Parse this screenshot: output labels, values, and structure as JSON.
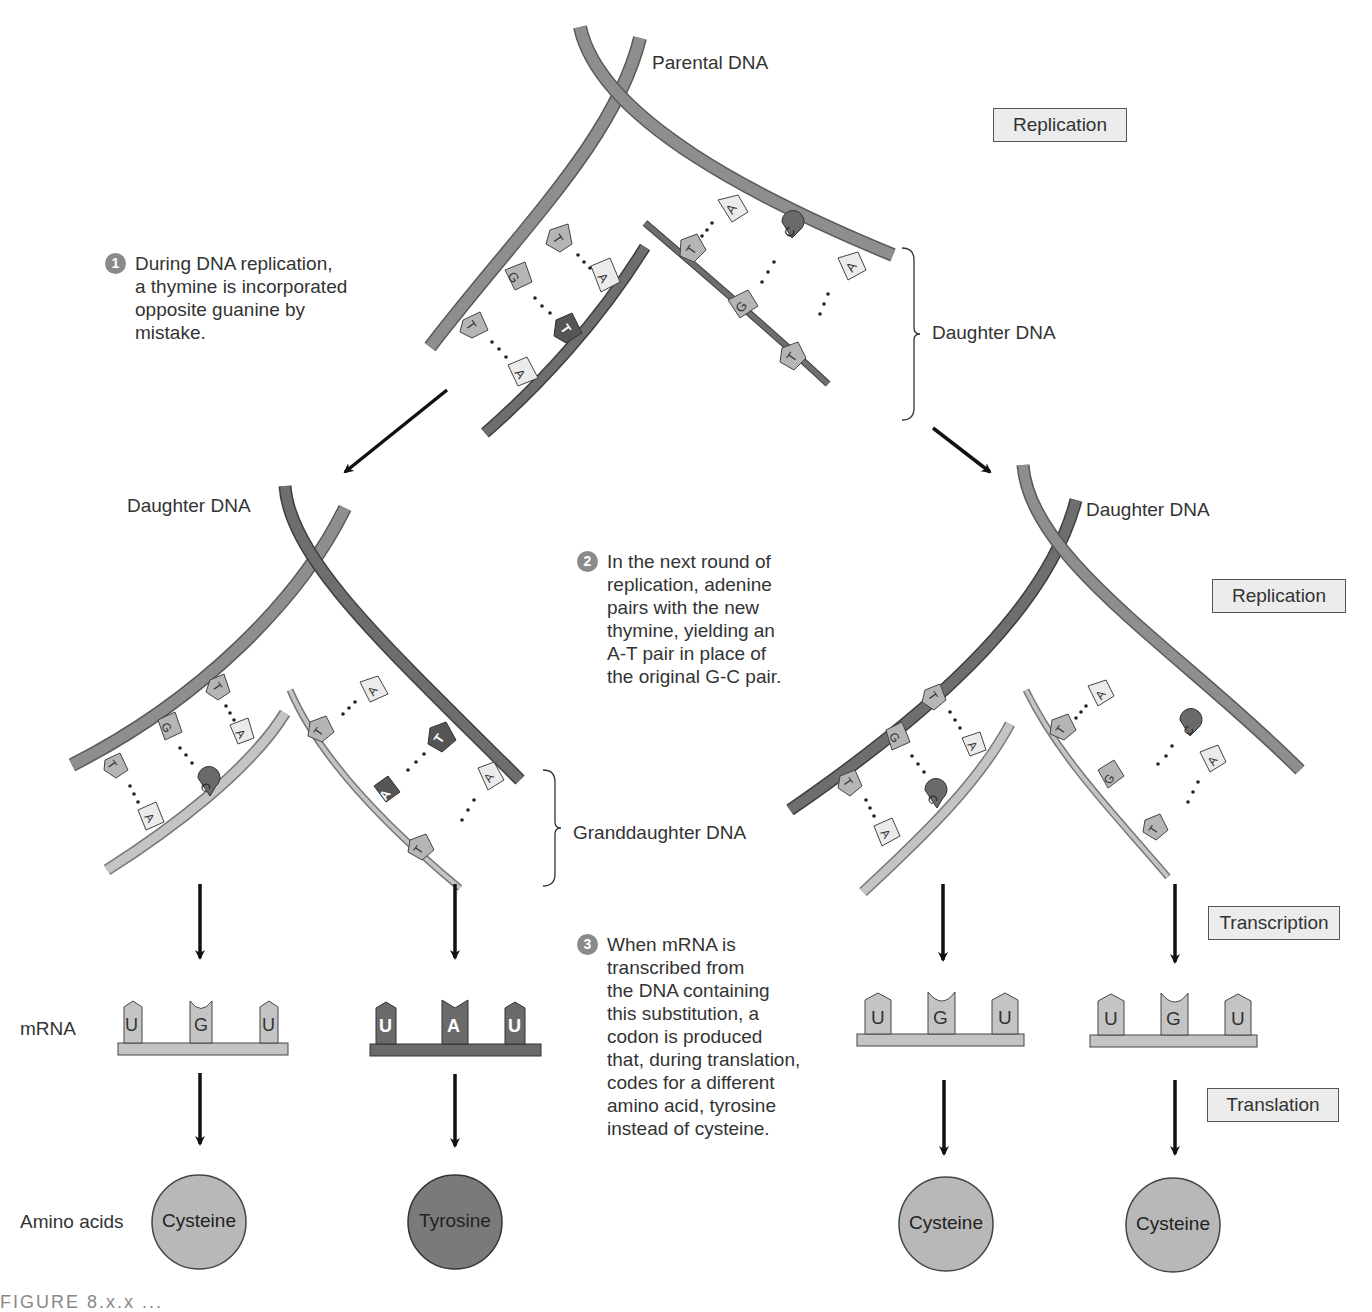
{
  "labels": {
    "parental_dna": "Parental DNA",
    "daughter_dna_top": "Daughter DNA",
    "daughter_dna_left": "Daughter DNA",
    "daughter_dna_right": "Daughter DNA",
    "granddaughter_dna": "Granddaughter DNA",
    "mrna": "mRNA",
    "amino_acids": "Amino acids"
  },
  "process_boxes": {
    "replication_top": "Replication",
    "replication_right": "Replication",
    "transcription": "Transcription",
    "translation": "Translation"
  },
  "steps": [
    {
      "num": "1",
      "text": "During DNA replication,\na thymine is incorporated\nopposite guanine by\nmistake."
    },
    {
      "num": "2",
      "text": "In the next round of\nreplication, adenine\npairs with the new\nthymine, yielding an\nA-T pair in place of\nthe original G-C pair."
    },
    {
      "num": "3",
      "text": "When mRNA is\ntranscribed from\nthe DNA containing\nthis substitution, a\ncodon is produced\nthat, during translation,\ncodes for a different\namino acid, tyrosine\ninstead of cysteine."
    }
  ],
  "bases": {
    "top_left_parent": [
      "T",
      "G",
      "T"
    ],
    "top_left_daughter": [
      "A",
      "T",
      "A"
    ],
    "top_right_parent": [
      "A",
      "C",
      "A"
    ],
    "top_right_daughter": [
      "T",
      "G",
      "T"
    ],
    "left_left_parent": [
      "T",
      "G",
      "T"
    ],
    "left_left_daughter": [
      "A",
      "C",
      "A"
    ],
    "left_right_parent": [
      "A",
      "T",
      "A"
    ],
    "left_right_daughter": [
      "T",
      "A",
      "T"
    ],
    "right_left_parent": [
      "T",
      "G",
      "T"
    ],
    "right_left_daughter": [
      "A",
      "C",
      "A"
    ],
    "right_right_parent": [
      "A",
      "C",
      "A"
    ],
    "right_right_daughter": [
      "T",
      "G",
      "T"
    ]
  },
  "codons": [
    {
      "bases": [
        "U",
        "G",
        "U"
      ],
      "amino_acid": "Cysteine",
      "mutant": false
    },
    {
      "bases": [
        "U",
        "A",
        "U"
      ],
      "amino_acid": "Tyrosine",
      "mutant": true
    },
    {
      "bases": [
        "U",
        "G",
        "U"
      ],
      "amino_acid": "Cysteine",
      "mutant": false
    },
    {
      "bases": [
        "U",
        "G",
        "U"
      ],
      "amino_acid": "Cysteine",
      "mutant": false
    }
  ],
  "colors": {
    "strand_medium": "#8e8e8e",
    "strand_dark": "#6e6e6e",
    "strand_light": "#c4c4c4",
    "base_light": "#ebebeb",
    "base_medium": "#b5b5b5",
    "base_dark": "#6a6a6a",
    "circle_light": "#b8b8b8",
    "circle_dark": "#7a7a7a",
    "box_fill": "#ececec",
    "step_badge": "#8a8a8a"
  },
  "caption_partial": "FIGURE 8.x.x  ..."
}
